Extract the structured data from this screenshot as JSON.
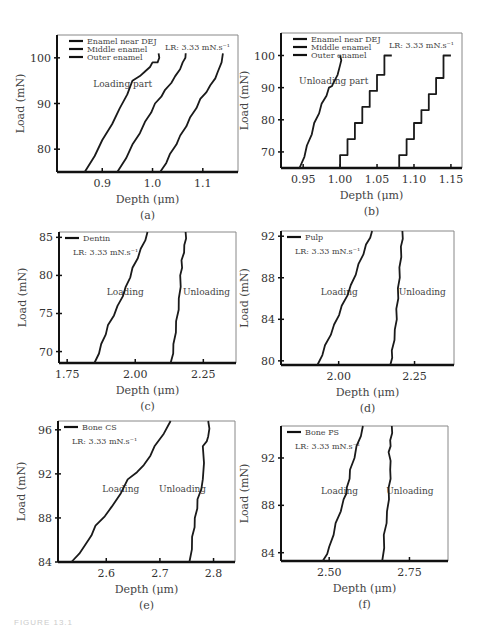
{
  "figure_caption": "FIGURE 13.1",
  "chart_data": [
    {
      "panel": "(a)",
      "type": "line",
      "title": "",
      "xlabel": "Depth (μm)",
      "ylabel": "Load (mN)",
      "xticks": [
        "0.9",
        "1.0",
        "1.1"
      ],
      "yticks": [
        "80",
        "90",
        "100"
      ],
      "xlim": [
        0.81,
        1.17
      ],
      "ylim": [
        75,
        105
      ],
      "annotation": "Loading part",
      "rate_label": "LR: 3.33 mN.s⁻¹",
      "legend": [
        "Enamel near DEJ",
        "Middle enamel",
        "Outer enamel"
      ],
      "series": [
        {
          "name": "Enamel near DEJ",
          "x": [
            0.865,
            0.9,
            0.935,
            0.96,
            0.985,
            1.0,
            1.01,
            1.012
          ],
          "y": [
            75,
            82,
            89,
            95,
            97,
            99,
            99,
            101
          ]
        },
        {
          "name": "Middle enamel",
          "x": [
            0.93,
            0.96,
            0.985,
            1.005,
            1.025,
            1.045,
            1.06,
            1.066
          ],
          "y": [
            75,
            81,
            86,
            90,
            93,
            96,
            99,
            101
          ]
        },
        {
          "name": "Outer enamel",
          "x": [
            1.015,
            1.035,
            1.055,
            1.075,
            1.095,
            1.115,
            1.13,
            1.14
          ],
          "y": [
            75,
            79,
            83,
            87,
            91,
            94,
            97,
            101
          ]
        }
      ]
    },
    {
      "panel": "(b)",
      "type": "line",
      "xlabel": "Depth (μm)",
      "ylabel": "Load (mN)",
      "xticks": [
        "0.95",
        "1.00",
        "1.05",
        "1.10",
        "1.15"
      ],
      "yticks": [
        "70",
        "80",
        "90",
        "100"
      ],
      "xlim": [
        0.92,
        1.165
      ],
      "ylim": [
        65,
        107
      ],
      "annotation": "Unloading part",
      "rate_label": "LR: 3.33 mN.s⁻¹",
      "legend": [
        "Enamel near DEJ",
        "Middle enamel",
        "Outer enamel"
      ],
      "series": [
        {
          "name": "Enamel near DEJ",
          "x": [
            0.945,
            0.955,
            0.965,
            0.975,
            0.985,
            0.99,
            1.0,
            1.0
          ],
          "y": [
            65,
            72,
            79,
            85,
            90,
            91,
            97,
            100
          ]
        },
        {
          "name": "Middle enamel",
          "x": [
            1.0,
            1.01,
            1.02,
            1.03,
            1.04,
            1.05,
            1.06,
            1.07
          ],
          "y": [
            65,
            69,
            74,
            79,
            84,
            89,
            94,
            100
          ]
        },
        {
          "name": "Outer enamel",
          "x": [
            1.08,
            1.09,
            1.1,
            1.11,
            1.12,
            1.13,
            1.14,
            1.15
          ],
          "y": [
            65,
            69,
            74,
            79,
            83,
            88,
            93,
            100
          ]
        }
      ]
    },
    {
      "panel": "(c)",
      "type": "line",
      "xlabel": "Depth (μm)",
      "ylabel": "Load (mN)",
      "xticks": [
        "1.75",
        "2.00",
        "2.25"
      ],
      "yticks": [
        "70",
        "75",
        "80",
        "85"
      ],
      "xlim": [
        1.72,
        2.37
      ],
      "ylim": [
        68.5,
        85.7
      ],
      "rate_label": "LR: 3.33 mN.s⁻¹",
      "legend": [
        "Dentin"
      ],
      "annotations": [
        "Loading",
        "Unloading"
      ],
      "series": [
        {
          "name": "Loading",
          "x": [
            1.85,
            1.875,
            1.9,
            1.935,
            1.965,
            1.99,
            2.02,
            2.045
          ],
          "y": [
            68.5,
            71,
            73.5,
            76,
            78.5,
            81,
            83.5,
            85.7
          ]
        },
        {
          "name": "Unloading",
          "x": [
            2.13,
            2.14,
            2.15,
            2.16,
            2.165,
            2.17,
            2.18,
            2.185
          ],
          "y": [
            68.5,
            71,
            74,
            77,
            80,
            82,
            84,
            85.7
          ]
        }
      ]
    },
    {
      "panel": "(d)",
      "type": "line",
      "xlabel": "Depth (μm)",
      "ylabel": "Load (mN)",
      "xticks": [
        "2.00",
        "2.25"
      ],
      "yticks": [
        "80",
        "84",
        "88",
        "92"
      ],
      "xlim": [
        1.81,
        2.38
      ],
      "ylim": [
        79.6,
        92.5
      ],
      "rate_label": "LR: 3.33 mN.s⁻¹",
      "legend": [
        "Pulp"
      ],
      "annotations": [
        "Loading",
        "Unloading"
      ],
      "series": [
        {
          "name": "Loading",
          "x": [
            1.93,
            1.955,
            1.985,
            2.01,
            2.04,
            2.065,
            2.09,
            2.11
          ],
          "y": [
            79.6,
            81.5,
            83.5,
            85.3,
            87.3,
            89.3,
            91.2,
            92.5
          ]
        },
        {
          "name": "Unloading",
          "x": [
            2.17,
            2.175,
            2.185,
            2.19,
            2.195,
            2.2,
            2.205,
            2.21
          ],
          "y": [
            79.6,
            81,
            83,
            85,
            87,
            89,
            91,
            92.5
          ]
        }
      ]
    },
    {
      "panel": "(e)",
      "type": "line",
      "xlabel": "Depth (μm)",
      "ylabel": "Load (mN)",
      "xticks": [
        "2.6",
        "2.7",
        "2.8"
      ],
      "yticks": [
        "84",
        "88",
        "92",
        "96"
      ],
      "xlim": [
        2.51,
        2.84
      ],
      "ylim": [
        84,
        96.8
      ],
      "rate_label": "LR: 3.33 mN.s⁻¹",
      "legend": [
        "Bone CS"
      ],
      "annotations": [
        "Loading",
        "Unloading"
      ],
      "series": [
        {
          "name": "Loading",
          "x": [
            2.535,
            2.56,
            2.58,
            2.61,
            2.64,
            2.67,
            2.69,
            2.72
          ],
          "y": [
            84,
            85.5,
            87.3,
            89,
            91.5,
            92.8,
            94.5,
            96.8
          ]
        },
        {
          "name": "Unloading",
          "x": [
            2.755,
            2.76,
            2.765,
            2.77,
            2.78,
            2.78,
            2.79,
            2.79
          ],
          "y": [
            84,
            86.3,
            88,
            89.7,
            91.5,
            94.5,
            95.4,
            96.8
          ]
        }
      ]
    },
    {
      "panel": "(f)",
      "type": "line",
      "xlabel": "Depth (μm)",
      "ylabel": "Load (mN)",
      "xticks": [
        "2.50",
        "2.75"
      ],
      "yticks": [
        "84",
        "88",
        "92"
      ],
      "xlim": [
        2.35,
        2.87
      ],
      "ylim": [
        83.3,
        94.7
      ],
      "rate_label": "LR: 3.33 mN.s⁻¹",
      "legend": [
        "Bone PS"
      ],
      "annotations": [
        "Loading",
        "Unloading"
      ],
      "series": [
        {
          "name": "Loading",
          "x": [
            2.48,
            2.5,
            2.52,
            2.545,
            2.555,
            2.565,
            2.585,
            2.605
          ],
          "y": [
            83.3,
            84.5,
            86.5,
            88.5,
            89.5,
            91,
            93,
            94.7
          ]
        },
        {
          "name": "Unloading",
          "x": [
            2.665,
            2.67,
            2.68,
            2.685,
            2.69,
            2.685,
            2.69,
            2.695
          ],
          "y": [
            83.3,
            85.5,
            87.5,
            89.5,
            91,
            92.5,
            93.5,
            94.7
          ]
        }
      ]
    }
  ]
}
